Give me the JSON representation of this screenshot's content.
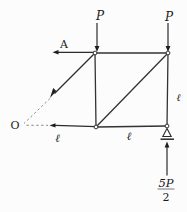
{
  "figure": {
    "type": "truss free-body diagram (method of sections)",
    "colors": {
      "background": "#fcfcfc",
      "line": "#333333",
      "dash": "#787878",
      "text": "#1a1a1a"
    },
    "labels": {
      "load_top_left": "P",
      "load_top_right": "P",
      "force_A": "A",
      "point_O": "O",
      "length_bottom_left": "ℓ",
      "length_bottom_right": "ℓ",
      "length_right_vertical": "ℓ",
      "reaction_numerator": "5P",
      "reaction_denominator": "2"
    }
  }
}
